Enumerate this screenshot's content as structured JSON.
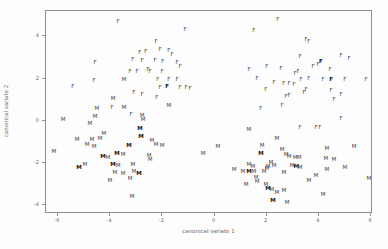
{
  "figure": {
    "background": "#fdfdfd",
    "box_color": "#8f8f8f",
    "marker_color": "#3c3c3c",
    "tick_label_color": "#6a6a6a"
  },
  "chart_data": {
    "type": "scatter",
    "title": "",
    "xlabel": "canonical variate 1",
    "ylabel": "canonical variate 2",
    "xlim": [
      -6.5,
      6.1
    ],
    "ylim": [
      -4.4,
      5.2
    ],
    "x_ticks": [
      -6,
      -4,
      -2,
      0,
      2,
      4,
      6
    ],
    "y_ticks": [
      -4,
      -2,
      0,
      2,
      4
    ],
    "grid": false,
    "legend": "none",
    "marker_style": "text-letter",
    "series": [
      {
        "name": "F",
        "points": [
          [
            -3.66,
            4.64
          ],
          [
            -4.54,
            2.69
          ],
          [
            -1.09,
            4.26
          ],
          [
            -2.2,
            3.69
          ],
          [
            -2.82,
            3.17
          ],
          [
            -2.59,
            3.21
          ],
          [
            -2.05,
            3.31
          ],
          [
            -1.71,
            3.26
          ],
          [
            -1.59,
            3.07
          ],
          [
            -3.09,
            2.83
          ],
          [
            -2.74,
            2.79
          ],
          [
            -2.24,
            2.79
          ],
          [
            -1.94,
            2.74
          ],
          [
            -1.4,
            2.69
          ],
          [
            -1.28,
            2.5
          ],
          [
            -3.2,
            2.27
          ],
          [
            -2.93,
            2.27
          ],
          [
            -2.51,
            2.36
          ],
          [
            -2.43,
            2.27
          ],
          [
            -1.97,
            2.27
          ],
          [
            -2.13,
            1.89
          ],
          [
            -1.71,
            1.89
          ],
          [
            -1.4,
            1.89
          ],
          [
            -2.05,
            1.51
          ],
          [
            -1.78,
            1.55,
            1
          ],
          [
            -1.28,
            1.51
          ],
          [
            -1.05,
            1.51
          ],
          [
            -0.9,
            1.46
          ],
          [
            -3.05,
            1.27
          ],
          [
            -2.74,
            1.18
          ],
          [
            -2.17,
            1.03
          ],
          [
            -5.39,
            1.55
          ],
          [
            -4.58,
            1.84
          ],
          [
            -3.16,
            0.23
          ],
          [
            -3.89,
            0.56
          ],
          [
            1.55,
            4.21
          ],
          [
            2.47,
            4.73
          ],
          [
            3.55,
            3.78
          ],
          [
            3.66,
            3.69
          ],
          [
            3.32,
            2.98
          ],
          [
            4.12,
            2.74,
            1
          ],
          [
            4.01,
            2.6
          ],
          [
            3.82,
            2.5
          ],
          [
            4.89,
            3.02
          ],
          [
            5.2,
            2.88
          ],
          [
            4.47,
            2.36
          ],
          [
            3.24,
            2.27
          ],
          [
            3.13,
            2.17
          ],
          [
            1.36,
            2.36
          ],
          [
            2.05,
            2.5
          ],
          [
            2.59,
            2.41
          ],
          [
            1.67,
            1.93
          ],
          [
            2.32,
            1.74
          ],
          [
            2.7,
            1.7
          ],
          [
            2.9,
            1.7
          ],
          [
            2.01,
            1.41
          ],
          [
            2.78,
            1.08
          ],
          [
            2.9,
            1.13
          ],
          [
            1.82,
            0.51
          ],
          [
            2.63,
            0.65
          ],
          [
            3.36,
            1.89
          ],
          [
            3.66,
            1.93
          ],
          [
            4.2,
            1.89
          ],
          [
            4.51,
            1.89,
            1
          ],
          [
            5.04,
            1.89
          ],
          [
            3.09,
            1.65
          ],
          [
            3.55,
            1.41
          ],
          [
            3.47,
            1.27
          ],
          [
            4.51,
            1.36
          ],
          [
            4.89,
            1.18
          ],
          [
            4.62,
            0.94
          ],
          [
            5.85,
            1.89
          ],
          [
            3.32,
            -0.39
          ],
          [
            3.93,
            -0.39
          ],
          [
            4.08,
            -0.39
          ],
          [
            4.89,
            0.04
          ]
        ]
      },
      {
        "name": "M",
        "points": [
          [
            -3.43,
            1.89
          ],
          [
            -3.85,
            0.99
          ],
          [
            -4.47,
            0.51
          ],
          [
            -3.43,
            0.56
          ],
          [
            -4.54,
            0.13
          ],
          [
            -5.77,
            -0.01
          ],
          [
            -4.74,
            -0.2
          ],
          [
            -4.2,
            -0.67
          ],
          [
            -5.23,
            -0.96
          ],
          [
            -4.66,
            -0.96
          ],
          [
            -4.35,
            -0.91
          ],
          [
            -1.71,
            0.65
          ],
          [
            -2.74,
            0.18
          ],
          [
            -2.7,
            -0.01
          ],
          [
            -2.82,
            -0.44,
            1
          ],
          [
            -2.78,
            -0.82,
            1
          ],
          [
            -2.36,
            -1.0
          ],
          [
            -4.85,
            -1.19
          ],
          [
            -4.58,
            -1.29
          ],
          [
            -6.12,
            -1.53
          ],
          [
            -4.24,
            -1.76,
            1
          ],
          [
            -4.05,
            -1.81
          ],
          [
            -3.7,
            -1.62,
            1
          ],
          [
            -3.47,
            -1.67
          ],
          [
            -4.93,
            -2.14
          ],
          [
            -5.16,
            -2.28,
            1
          ],
          [
            -3.85,
            -2.14,
            1
          ],
          [
            -3.66,
            -2.19
          ],
          [
            -3.78,
            -2.52
          ],
          [
            -3.47,
            -2.57
          ],
          [
            -3.97,
            -2.9
          ],
          [
            -3.24,
            -1.24,
            1
          ],
          [
            -2.2,
            -1.19
          ],
          [
            -1.97,
            -1.24
          ],
          [
            -2.47,
            -1.72
          ],
          [
            -2.43,
            -1.9
          ],
          [
            -3.09,
            -2.14
          ],
          [
            -3.05,
            -2.47
          ],
          [
            -2.86,
            -2.57,
            1
          ],
          [
            -3.2,
            -2.81
          ],
          [
            -3.12,
            -3.66
          ],
          [
            0.17,
            -1.29
          ],
          [
            -0.4,
            -1.62
          ],
          [
            1.86,
            -1.24
          ],
          [
            1.82,
            -1.62,
            1
          ],
          [
            2.63,
            -1.43
          ],
          [
            2.78,
            -1.67
          ],
          [
            2.9,
            -1.76
          ],
          [
            1.36,
            -2.14
          ],
          [
            1.51,
            -2.24
          ],
          [
            2.2,
            -2.05
          ],
          [
            2.09,
            -2.24
          ],
          [
            2.32,
            -2.19
          ],
          [
            0.79,
            -2.38
          ],
          [
            1.13,
            -2.47
          ],
          [
            1.36,
            -2.47,
            1
          ],
          [
            1.55,
            -2.47
          ],
          [
            1.94,
            -2.47
          ],
          [
            2.05,
            -2.33
          ],
          [
            2.7,
            -2.52
          ],
          [
            1.63,
            -2.76
          ],
          [
            1.67,
            -2.95
          ],
          [
            1.25,
            -3.09
          ],
          [
            2.01,
            -3.09
          ],
          [
            2.09,
            -3.28,
            1
          ],
          [
            2.24,
            -3.33
          ],
          [
            2.7,
            -3.38
          ],
          [
            2.43,
            -3.47
          ],
          [
            1.36,
            -0.48
          ],
          [
            2.43,
            -0.91
          ],
          [
            2.28,
            -3.85,
            1
          ],
          [
            2.82,
            -3.95
          ],
          [
            4.35,
            -1.38
          ],
          [
            5.39,
            -1.29
          ],
          [
            3.13,
            -1.81
          ],
          [
            3.28,
            -1.81
          ],
          [
            4.31,
            -1.86
          ],
          [
            4.62,
            -1.9
          ],
          [
            3.01,
            -2.19
          ],
          [
            3.17,
            -2.24,
            1
          ],
          [
            3.32,
            -2.28
          ],
          [
            4.35,
            -2.38
          ],
          [
            5.04,
            -2.28
          ],
          [
            3.93,
            -2.66
          ],
          [
            3.66,
            -2.9
          ],
          [
            5.96,
            -2.81
          ],
          [
            4.2,
            -3.56
          ]
        ]
      }
    ]
  }
}
